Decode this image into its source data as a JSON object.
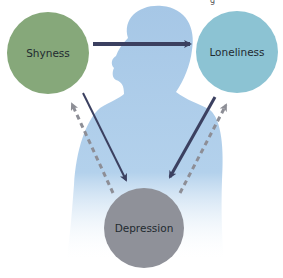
{
  "diagram": {
    "type": "cycle-relationship",
    "nodes": [
      {
        "id": "shyness",
        "label": "Shyness",
        "color": "#86a87a",
        "cx": 48,
        "cy": 53,
        "r": 41
      },
      {
        "id": "loneliness",
        "label": "Loneliness",
        "color": "#8cc3d3",
        "cx": 237,
        "cy": 52,
        "r": 41
      },
      {
        "id": "depression",
        "label": "Depression",
        "color": "#8f9199",
        "cx": 144,
        "cy": 228,
        "r": 40
      }
    ],
    "edges": [
      {
        "from": "shyness",
        "to": "loneliness",
        "style": "solid"
      },
      {
        "from": "shyness",
        "to": "depression",
        "style": "solid"
      },
      {
        "from": "loneliness",
        "to": "depression",
        "style": "solid"
      },
      {
        "from": "depression",
        "to": "shyness",
        "style": "dashed"
      },
      {
        "from": "depression",
        "to": "loneliness",
        "style": "dashed"
      }
    ],
    "colors": {
      "solid_arrow": "#3b4060",
      "dashed_arrow": "#8d8e96",
      "silhouette": "#a9c9e6"
    }
  }
}
